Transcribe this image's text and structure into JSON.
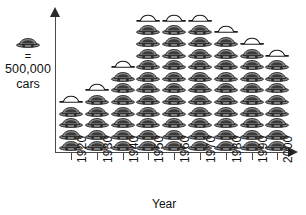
{
  "chart_data": {
    "type": "pictograph",
    "title": "",
    "xlabel": "Year",
    "ylabel": "",
    "icon": "car-icon",
    "icon_value": 500000,
    "icon_unit": "cars",
    "legend": {
      "equals_symbol": "=",
      "value_label": "500,000",
      "unit_label": "cars"
    },
    "categories": [
      "1920",
      "1930",
      "1940",
      "1950",
      "1960",
      "1970",
      "1980",
      "1990",
      "2000"
    ],
    "icon_counts": [
      4.5,
      5.5,
      7.5,
      11.5,
      11.5,
      11.5,
      10.5,
      9.5,
      8.5
    ],
    "values": [
      2250000,
      2750000,
      3750000,
      5750000,
      5750000,
      5750000,
      5250000,
      4750000,
      4250000
    ],
    "grid": false,
    "legend_position": "left",
    "axis_arrows": {
      "vertical": true,
      "horizontal": true
    }
  },
  "colors": {
    "axis": "#4a4a4a",
    "arrow": "#2b2b2b",
    "icon_body": "#8d8d8d",
    "icon_outline": "#1c1c1c",
    "icon_window": "#3a3a3a",
    "text": "#111111"
  }
}
